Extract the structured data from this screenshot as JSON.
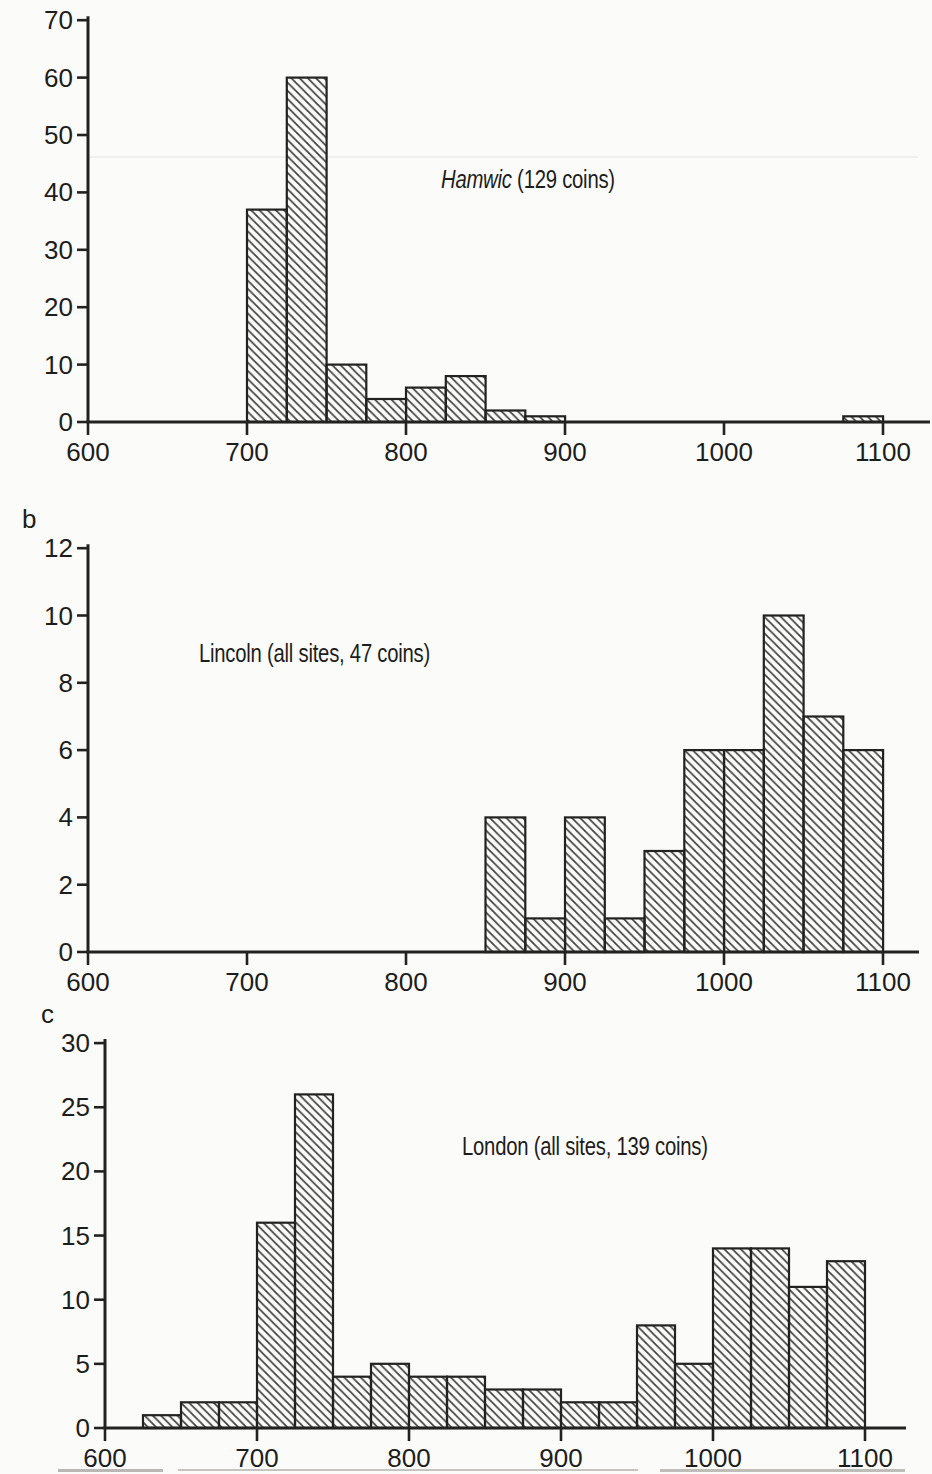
{
  "figure_description": "Three stacked histograms of coin finds by 25-year date bins, 600-1100",
  "chart_data": [
    {
      "type": "histogram",
      "panel_label": "",
      "title": "Hamwic (129 coins)",
      "title_italic_part": "Hamwic",
      "title_regular_part": " (129 coins)",
      "total_coins_label": 129,
      "bin_width": 25,
      "x_ticks": [
        600,
        700,
        800,
        900,
        1000,
        1100
      ],
      "y_ticks": [
        0,
        10,
        20,
        30,
        40,
        50,
        60,
        70
      ],
      "xlim": [
        600,
        1130
      ],
      "ylim": [
        0,
        70
      ],
      "grid": false,
      "hatch": "diagonal-down",
      "bins": [
        {
          "start": 700,
          "end": 725,
          "count": 37
        },
        {
          "start": 725,
          "end": 750,
          "count": 60
        },
        {
          "start": 750,
          "end": 775,
          "count": 10
        },
        {
          "start": 775,
          "end": 800,
          "count": 4
        },
        {
          "start": 800,
          "end": 825,
          "count": 6
        },
        {
          "start": 825,
          "end": 850,
          "count": 8
        },
        {
          "start": 850,
          "end": 875,
          "count": 2
        },
        {
          "start": 875,
          "end": 900,
          "count": 1
        },
        {
          "start": 1075,
          "end": 1100,
          "count": 1
        }
      ]
    },
    {
      "type": "histogram",
      "panel_label": "b",
      "title": "Lincoln (all sites, 47 coins)",
      "title_italic_part": "",
      "title_regular_part": "Lincoln (all sites, 47 coins)",
      "total_coins_label": 47,
      "bin_width": 25,
      "x_ticks": [
        600,
        700,
        800,
        900,
        1000,
        1100
      ],
      "y_ticks": [
        0,
        2,
        4,
        6,
        8,
        10,
        12
      ],
      "xlim": [
        600,
        1123
      ],
      "ylim": [
        0,
        12
      ],
      "grid": false,
      "hatch": "diagonal-down",
      "bins": [
        {
          "start": 850,
          "end": 875,
          "count": 4
        },
        {
          "start": 875,
          "end": 900,
          "count": 1
        },
        {
          "start": 900,
          "end": 925,
          "count": 4
        },
        {
          "start": 925,
          "end": 950,
          "count": 1
        },
        {
          "start": 950,
          "end": 975,
          "count": 3
        },
        {
          "start": 975,
          "end": 1000,
          "count": 6
        },
        {
          "start": 1000,
          "end": 1025,
          "count": 6
        },
        {
          "start": 1025,
          "end": 1050,
          "count": 10
        },
        {
          "start": 1050,
          "end": 1075,
          "count": 7
        },
        {
          "start": 1075,
          "end": 1100,
          "count": 6
        }
      ]
    },
    {
      "type": "histogram",
      "panel_label": "c",
      "title": "London (all sites, 139 coins)",
      "title_italic_part": "",
      "title_regular_part": "London (all sites, 139 coins)",
      "total_coins_label": 139,
      "bin_width": 25,
      "x_ticks": [
        600,
        700,
        800,
        900,
        1000,
        1100
      ],
      "y_ticks": [
        0,
        5,
        10,
        15,
        20,
        25,
        30
      ],
      "xlim": [
        600,
        1127
      ],
      "ylim": [
        0,
        30
      ],
      "grid": false,
      "hatch": "diagonal-down",
      "bins": [
        {
          "start": 625,
          "end": 650,
          "count": 1
        },
        {
          "start": 650,
          "end": 675,
          "count": 2
        },
        {
          "start": 675,
          "end": 700,
          "count": 2
        },
        {
          "start": 700,
          "end": 725,
          "count": 16
        },
        {
          "start": 725,
          "end": 750,
          "count": 26
        },
        {
          "start": 750,
          "end": 775,
          "count": 4
        },
        {
          "start": 775,
          "end": 800,
          "count": 5
        },
        {
          "start": 800,
          "end": 825,
          "count": 4
        },
        {
          "start": 825,
          "end": 850,
          "count": 4
        },
        {
          "start": 850,
          "end": 875,
          "count": 3
        },
        {
          "start": 875,
          "end": 900,
          "count": 3
        },
        {
          "start": 900,
          "end": 925,
          "count": 2
        },
        {
          "start": 925,
          "end": 950,
          "count": 2
        },
        {
          "start": 950,
          "end": 975,
          "count": 8
        },
        {
          "start": 975,
          "end": 1000,
          "count": 5
        },
        {
          "start": 1000,
          "end": 1025,
          "count": 14
        },
        {
          "start": 1025,
          "end": 1050,
          "count": 14
        },
        {
          "start": 1050,
          "end": 1075,
          "count": 11
        },
        {
          "start": 1075,
          "end": 1100,
          "count": 13
        }
      ]
    }
  ],
  "colors": {
    "ink": "#222220",
    "paper": "#fbfbf9",
    "hatch_line": "#3a3a38"
  }
}
